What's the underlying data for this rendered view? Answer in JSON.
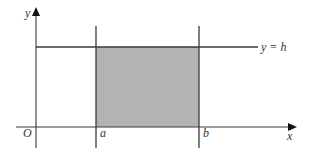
{
  "diagram": {
    "colors": {
      "line": "#3a3a3a",
      "fill": "#b3b3b3",
      "background": "#ffffff"
    },
    "axes": {
      "x_label": "x",
      "y_label": "y",
      "origin_label": "O"
    },
    "vertical_lines": [
      {
        "label": "a"
      },
      {
        "label": "b"
      }
    ],
    "horizontal_line": {
      "label": "y = h"
    },
    "shaded_region": "rectangle between x = a and x = b, from x-axis up to y = h"
  }
}
